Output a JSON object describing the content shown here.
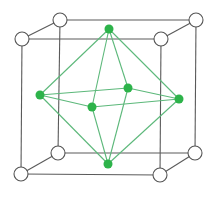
{
  "diagram": {
    "title": "",
    "colors": {
      "background": "#ffffff",
      "cube_edge": "#5a5a5a",
      "corner_fill": "#ffffff",
      "corner_stroke": "#555555",
      "octa_edge": "#5cb87a",
      "octa_node": "#2db34a"
    },
    "cube_corners": [
      {
        "id": "FTL",
        "x": 22,
        "y": 39,
        "r": 7
      },
      {
        "id": "FTR",
        "x": 161,
        "y": 39,
        "r": 7
      },
      {
        "id": "FBL",
        "x": 21,
        "y": 174,
        "r": 7
      },
      {
        "id": "FBR",
        "x": 160,
        "y": 175,
        "r": 7
      },
      {
        "id": "BTL",
        "x": 60,
        "y": 20,
        "r": 7
      },
      {
        "id": "BTR",
        "x": 196,
        "y": 20,
        "r": 7
      },
      {
        "id": "BBL",
        "x": 58,
        "y": 153,
        "r": 7
      },
      {
        "id": "BBR",
        "x": 195,
        "y": 153,
        "r": 7
      }
    ],
    "cube_edges": [
      [
        "FTL",
        "FTR"
      ],
      [
        "FTR",
        "FBR"
      ],
      [
        "FBR",
        "FBL"
      ],
      [
        "FBL",
        "FTL"
      ],
      [
        "BTL",
        "BTR"
      ],
      [
        "BTR",
        "BBR"
      ],
      [
        "BBR",
        "BBL"
      ],
      [
        "BBL",
        "BTL"
      ],
      [
        "FTL",
        "BTL"
      ],
      [
        "FTR",
        "BTR"
      ],
      [
        "FBL",
        "BBL"
      ],
      [
        "FBR",
        "BBR"
      ]
    ],
    "octa_nodes": [
      {
        "id": "TOP",
        "x": 109,
        "y": 29,
        "r": 4.5
      },
      {
        "id": "BOT",
        "x": 108,
        "y": 164,
        "r": 4.5
      },
      {
        "id": "LEFT",
        "x": 40,
        "y": 95,
        "r": 4.5
      },
      {
        "id": "RIGHT",
        "x": 179,
        "y": 99,
        "r": 4.5
      },
      {
        "id": "BACK",
        "x": 128,
        "y": 88,
        "r": 4.5
      },
      {
        "id": "FRONT",
        "x": 92,
        "y": 107,
        "r": 4.5
      }
    ],
    "octa_edges": [
      [
        "TOP",
        "LEFT"
      ],
      [
        "TOP",
        "RIGHT"
      ],
      [
        "TOP",
        "BACK"
      ],
      [
        "TOP",
        "FRONT"
      ],
      [
        "BOT",
        "LEFT"
      ],
      [
        "BOT",
        "RIGHT"
      ],
      [
        "BOT",
        "BACK"
      ],
      [
        "BOT",
        "FRONT"
      ],
      [
        "LEFT",
        "BACK"
      ],
      [
        "BACK",
        "RIGHT"
      ],
      [
        "RIGHT",
        "FRONT"
      ],
      [
        "FRONT",
        "LEFT"
      ]
    ]
  }
}
